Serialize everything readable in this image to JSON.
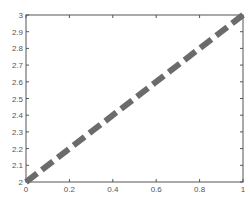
{
  "chart_data": {
    "type": "line",
    "title": "",
    "xlabel": "",
    "ylabel": "",
    "xlim": [
      0,
      1
    ],
    "ylim": [
      2,
      3
    ],
    "grid": false,
    "legend": null,
    "x_ticks": [
      "0",
      "0.2",
      "0.4",
      "0.6",
      "0.8",
      "1"
    ],
    "y_ticks": [
      "2",
      "2.1",
      "2.2",
      "2.3",
      "2.4",
      "2.5",
      "2.6",
      "2.7",
      "2.8",
      "2.9",
      "3"
    ],
    "series": [
      {
        "name": "line",
        "x": [
          0,
          1
        ],
        "y": [
          2,
          3
        ],
        "color": "#6b6b6b",
        "line_style": "dashed",
        "line_width": 6
      }
    ]
  },
  "colors": {
    "axis": "#555555",
    "line": "#6b6b6b",
    "background": "#ffffff"
  }
}
